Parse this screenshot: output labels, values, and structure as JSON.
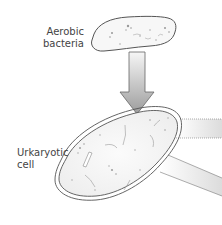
{
  "diagram": {
    "labels": {
      "bacteria": [
        "Aerobic",
        "bacteria"
      ],
      "cell": [
        "Urkaryotic",
        "cell"
      ]
    },
    "colors": {
      "outline": "#555555",
      "arrow_fill_top": "#f2f2f2",
      "arrow_fill_bottom": "#9a9a9a",
      "cell_fill": "#f4f4f4",
      "text": "#444444"
    },
    "elements": [
      {
        "id": "aerobic-bacteria",
        "type": "blob"
      },
      {
        "id": "down-arrow",
        "type": "arrow",
        "direction": "down"
      },
      {
        "id": "urkaryotic-cell",
        "type": "double-outlined blob"
      },
      {
        "id": "band-upper",
        "type": "gradient band",
        "direction": "right"
      },
      {
        "id": "band-lower",
        "type": "gradient band",
        "direction": "right-down"
      }
    ]
  }
}
